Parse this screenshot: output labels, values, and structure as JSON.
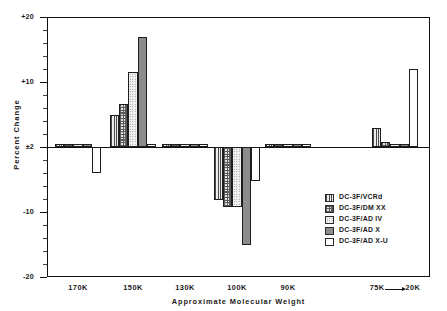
{
  "chart_data": {
    "type": "bar",
    "title": "",
    "xlabel": "Approximate  Molecular  Weight",
    "ylabel": "Percent  Change",
    "ylim": [
      -20,
      20
    ],
    "ytick_labels": [
      "+20",
      "+10",
      "±2",
      "-10",
      "-20"
    ],
    "ytick_values": [
      20,
      10,
      0,
      -10,
      -20
    ],
    "grid": false,
    "legend_position": "inside-lower-right",
    "categories": [
      "170K",
      "150K",
      "130K",
      "100K",
      "90K",
      "75K→20K"
    ],
    "category_labels": [
      "170K",
      "150K",
      "130K",
      "100K",
      "90K",
      "75K",
      "20K"
    ],
    "series": [
      {
        "name": "DC-3F/VCRd",
        "pattern": "vertical-lines",
        "values": [
          0.4,
          5.0,
          0.4,
          -8.1,
          0.4,
          3.0
        ]
      },
      {
        "name": "DC-3F/DM XX",
        "pattern": "checkered",
        "values": [
          0.4,
          6.6,
          0.4,
          -9.2,
          0.4,
          0.7
        ]
      },
      {
        "name": "DC-3F/AD IV",
        "pattern": "fine-dots",
        "values": [
          0.4,
          11.5,
          0.4,
          -9.2,
          0.4,
          0.5
        ]
      },
      {
        "name": "DC-3F/AD X",
        "pattern": "solid-gray",
        "values": [
          0.4,
          17.0,
          0.4,
          -15.0,
          0.4,
          0.4
        ]
      },
      {
        "name": "DC-3F/AD X-U",
        "pattern": "white",
        "values": [
          -4.0,
          0.4,
          0.4,
          -5.3,
          0.4,
          12.0
        ]
      }
    ]
  },
  "legend": {
    "items": [
      {
        "label": "DC-3F/VCRd",
        "pattern": "vertical-lines"
      },
      {
        "label": "DC-3F/DM XX",
        "pattern": "checkered"
      },
      {
        "label": "DC-3F/AD IV",
        "pattern": "fine-dots"
      },
      {
        "label": "DC-3F/AD X",
        "pattern": "solid-gray"
      },
      {
        "label": "DC-3F/AD X-U",
        "pattern": "white"
      }
    ]
  },
  "axes": {
    "y_title": "Percent  Change",
    "x_title": "Approximate  Molecular  Weight",
    "y_labels": [
      "+20",
      "+10",
      "±2",
      "-10",
      "-20"
    ],
    "x_labels": [
      "170K",
      "150K",
      "130K",
      "100K",
      "90K"
    ],
    "x_last_from": "75K",
    "x_last_to": "20K"
  }
}
